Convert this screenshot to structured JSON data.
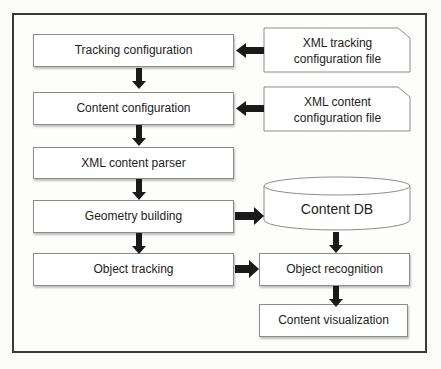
{
  "diagram": {
    "left_column": [
      {
        "id": "tracking-configuration",
        "label": "Tracking configuration"
      },
      {
        "id": "content-configuration",
        "label": "Content configuration"
      },
      {
        "id": "xml-content-parser",
        "label": "XML content parser"
      },
      {
        "id": "geometry-building",
        "label": "Geometry building"
      },
      {
        "id": "object-tracking",
        "label": "Object tracking"
      }
    ],
    "files": [
      {
        "id": "xml-tracking-file",
        "line1": "XML tracking",
        "line2": "configuration file"
      },
      {
        "id": "xml-content-file",
        "line1": "XML content",
        "line2": "configuration file"
      }
    ],
    "database": {
      "id": "content-db",
      "label": "Content DB"
    },
    "right_column": [
      {
        "id": "object-recognition",
        "label": "Object recognition"
      },
      {
        "id": "content-visualization",
        "label": "Content visualization"
      }
    ],
    "edges": [
      {
        "from": "xml-tracking-file",
        "to": "tracking-configuration"
      },
      {
        "from": "xml-content-file",
        "to": "content-configuration"
      },
      {
        "from": "tracking-configuration",
        "to": "content-configuration"
      },
      {
        "from": "content-configuration",
        "to": "xml-content-parser"
      },
      {
        "from": "xml-content-parser",
        "to": "geometry-building"
      },
      {
        "from": "geometry-building",
        "to": "object-tracking"
      },
      {
        "from": "geometry-building",
        "to": "content-db"
      },
      {
        "from": "content-db",
        "to": "object-recognition"
      },
      {
        "from": "object-tracking",
        "to": "object-recognition"
      },
      {
        "from": "object-recognition",
        "to": "content-visualization"
      }
    ],
    "colors": {
      "frame": "#3a3a3a",
      "box_border": "#8c8c8c",
      "arrow": "#1a1a1a",
      "box_fill": "#ffffff"
    }
  }
}
